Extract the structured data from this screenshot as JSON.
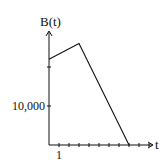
{
  "chart_data": {
    "type": "line",
    "title": "",
    "xlabel": "t",
    "ylabel": "B(t)",
    "x": [
      0,
      3,
      8
    ],
    "series": [
      {
        "name": "B(t)",
        "values": [
          22000,
          26000,
          0
        ]
      }
    ],
    "x_tick_labels": [
      {
        "value": 1,
        "label": "1"
      }
    ],
    "y_tick_labels": [
      {
        "value": 10000,
        "label": "10,000"
      }
    ],
    "x_ticks": [
      1,
      2,
      3,
      4,
      5,
      6,
      7,
      8,
      9,
      10
    ],
    "y_ticks": [
      10000,
      20000
    ],
    "xlim": [
      0,
      10.3
    ],
    "ylim": [
      0,
      31000
    ],
    "grid": false,
    "legend": "none"
  },
  "labels": {
    "y_axis": "B(t)",
    "x_axis": "t",
    "y_tick": "10,000",
    "x_tick": "1"
  },
  "colors": {
    "line": "#111111",
    "axis": "#111111"
  }
}
